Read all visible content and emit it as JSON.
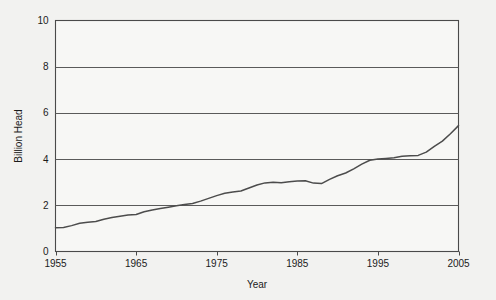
{
  "chart_data": {
    "type": "line",
    "title": "",
    "xlabel": "Year",
    "ylabel": "Billion Head",
    "xlim": [
      1955,
      2005
    ],
    "ylim": [
      0,
      10
    ],
    "grid": true,
    "legend": "none",
    "xticks": [
      "1955",
      "1965",
      "1975",
      "1985",
      "1995",
      "2005"
    ],
    "xtick_values": [
      1955,
      1965,
      1975,
      1985,
      1995,
      2005
    ],
    "yticks": [
      "0",
      "2",
      "4",
      "6",
      "8",
      "10"
    ],
    "ytick_values": [
      0,
      2,
      4,
      6,
      8,
      10
    ],
    "x": [
      1955,
      1956,
      1957,
      1958,
      1959,
      1960,
      1961,
      1962,
      1963,
      1964,
      1965,
      1966,
      1967,
      1968,
      1969,
      1970,
      1971,
      1972,
      1973,
      1974,
      1975,
      1976,
      1977,
      1978,
      1979,
      1980,
      1981,
      1982,
      1983,
      1984,
      1985,
      1986,
      1987,
      1988,
      1989,
      1990,
      1991,
      1992,
      1993,
      1994,
      1995,
      1996,
      1997,
      1998,
      1999,
      2000,
      2001,
      2002,
      2003,
      2004,
      2005
    ],
    "values": [
      1.03,
      1.04,
      1.12,
      1.22,
      1.27,
      1.3,
      1.4,
      1.47,
      1.53,
      1.58,
      1.6,
      1.72,
      1.8,
      1.86,
      1.92,
      1.98,
      2.03,
      2.08,
      2.18,
      2.3,
      2.42,
      2.52,
      2.58,
      2.62,
      2.75,
      2.88,
      2.97,
      3.0,
      2.98,
      3.02,
      3.05,
      3.06,
      2.96,
      2.94,
      3.12,
      3.28,
      3.4,
      3.58,
      3.78,
      3.95,
      4.0,
      4.03,
      4.06,
      4.12,
      4.14,
      4.16,
      4.3,
      4.55,
      4.78,
      5.1,
      5.45
    ],
    "series_name": "Billion Head",
    "line_color": "#4c4c4c",
    "background_color": "#f7f7f5",
    "grid_color": "#5a5a5a"
  },
  "axes": {
    "y_title": "Billion Head",
    "x_title": "Year"
  }
}
